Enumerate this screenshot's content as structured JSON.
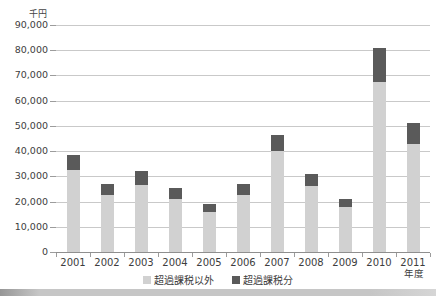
{
  "chart_data": {
    "type": "bar",
    "stacked": true,
    "unit_label": "千円",
    "x_axis_label": "年度",
    "categories": [
      "2001",
      "2002",
      "2003",
      "2004",
      "2005",
      "2006",
      "2007",
      "2008",
      "2009",
      "2010",
      "2011"
    ],
    "series": [
      {
        "name": "超過課税以外",
        "color": "#d1d1d1",
        "values": [
          32500,
          22500,
          26500,
          21000,
          16000,
          22500,
          40000,
          26000,
          18000,
          67500,
          43000
        ]
      },
      {
        "name": "超過課税分",
        "color": "#5a5a5a",
        "values": [
          6000,
          4500,
          5500,
          4500,
          3000,
          4500,
          6500,
          5000,
          3000,
          13500,
          8000
        ]
      }
    ],
    "totals": [
      38500,
      27000,
      32000,
      25500,
      19000,
      27000,
      46500,
      31000,
      21000,
      81000,
      51000
    ],
    "ylim": [
      0,
      90000
    ],
    "ytick_interval": 10000,
    "ytick_labels": [
      "90,000",
      "80,000",
      "70,000",
      "60,000",
      "50,000",
      "40,000",
      "30,000",
      "20,000",
      "10,000",
      "0"
    ],
    "grid": true,
    "legend_position": "bottom"
  },
  "colors": {
    "gridline": "#c9c9c9",
    "axis": "#8f8f8f",
    "text": "#3d3d3d",
    "scan_shadow": "#c6c6c6"
  }
}
